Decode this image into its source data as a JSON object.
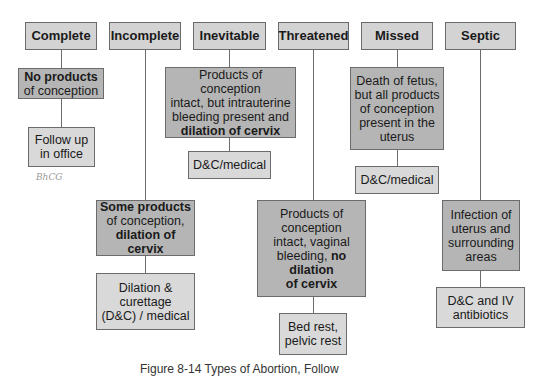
{
  "diagram": {
    "columns": [
      {
        "header": "Complete",
        "description": [
          {
            "text": "No products",
            "bold": true
          },
          {
            "text": "of conception",
            "bold": false
          }
        ],
        "treatment": [
          "Follow up",
          "in office"
        ],
        "annotation": "BhCG"
      },
      {
        "header": "Incomplete",
        "description": [
          {
            "text": "Some products",
            "bold": true
          },
          {
            "text": "of conception,",
            "bold": false
          },
          {
            "text": "dilation of cervix",
            "bold": true
          }
        ],
        "treatment": [
          "Dilation &",
          "curettage",
          "(D&C) / medical"
        ]
      },
      {
        "header": "Inevitable",
        "description": [
          {
            "text": "Products of conception",
            "bold": false
          },
          {
            "text": "intact, but intrauterine",
            "bold": false
          },
          {
            "text": "bleeding present and",
            "bold": false
          },
          {
            "text": "dilation of cervix",
            "bold": true
          }
        ],
        "treatment": [
          "D&C/medical"
        ]
      },
      {
        "header": "Threatened",
        "description": [
          {
            "text": "Products of",
            "bold": false
          },
          {
            "text": "conception",
            "bold": false
          },
          {
            "text": "intact, vaginal",
            "bold": false
          },
          {
            "text": "bleeding, ",
            "bold": false,
            "suffix_bold": "no"
          },
          {
            "text": "dilation",
            "bold": true
          },
          {
            "text": "of cervix",
            "bold": true
          }
        ],
        "treatment": [
          "Bed rest,",
          "pelvic rest"
        ]
      },
      {
        "header": "Missed",
        "description": [
          {
            "text": "Death of fetus,",
            "bold": false
          },
          {
            "text": "but all products",
            "bold": false
          },
          {
            "text": "of conception",
            "bold": false
          },
          {
            "text": "present in the",
            "bold": false
          },
          {
            "text": "uterus",
            "bold": false
          }
        ],
        "treatment": [
          "D&C/medical"
        ]
      },
      {
        "header": "Septic",
        "description": [
          {
            "text": "Infection of",
            "bold": false
          },
          {
            "text": "uterus and",
            "bold": false
          },
          {
            "text": "surrounding",
            "bold": false
          },
          {
            "text": "areas",
            "bold": false
          }
        ],
        "treatment": [
          "D&C and IV",
          "antibiotics"
        ]
      }
    ],
    "caption": "Figure 8-14 Types of Abortion, Follow"
  },
  "colors": {
    "header_fill": "#d3d3d3",
    "description_fill": "#b5b5b5",
    "treatment_fill": "#d9d9d9",
    "border": "#6b6b6b"
  }
}
